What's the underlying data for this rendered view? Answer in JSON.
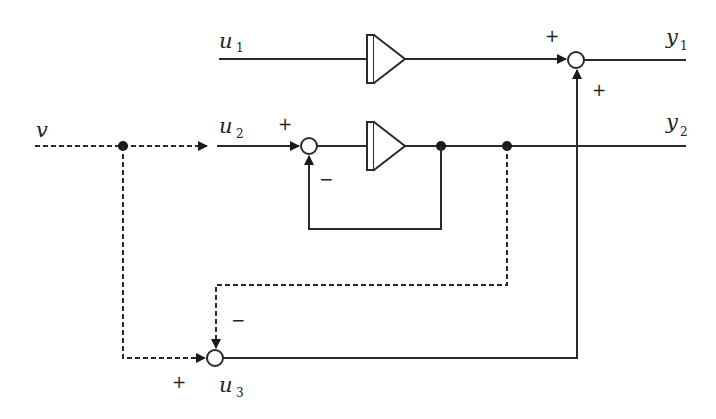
{
  "diagram": {
    "type": "signal-flow block diagram",
    "signals": {
      "v": "v",
      "u1": {
        "base": "u",
        "sub": "1"
      },
      "u2": {
        "base": "u",
        "sub": "2"
      },
      "u3": {
        "base": "u",
        "sub": "3"
      },
      "y1": {
        "base": "y",
        "sub": "1"
      },
      "y2": {
        "base": "y",
        "sub": "2"
      }
    },
    "signs": {
      "sum1_left": "+",
      "sum1_bottom": "+",
      "sum2_left": "+",
      "sum2_bottom": "−",
      "sum3_left": "+",
      "sum3_top": "−"
    },
    "blocks": [
      {
        "id": "integrator-1",
        "input": "u1",
        "output": "sum1"
      },
      {
        "id": "integrator-2",
        "input": "sum2",
        "output": "y2"
      }
    ],
    "summing_junctions": [
      {
        "id": "sum1",
        "inputs": [
          "integrator-1 (+)",
          "u3 (+)"
        ],
        "output": "y1"
      },
      {
        "id": "sum2",
        "inputs": [
          "u2 (+)",
          "integrator-2 feedback (−)"
        ],
        "output": "integrator-2"
      },
      {
        "id": "sum3",
        "inputs": [
          "v (+)",
          "y2 (−)"
        ],
        "output": "u3"
      }
    ],
    "colors": {
      "line": "#2a2a2a",
      "background": "#ffffff"
    }
  }
}
